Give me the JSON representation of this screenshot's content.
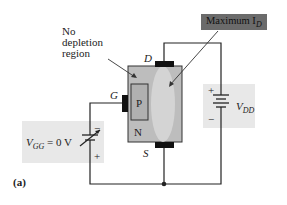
{
  "diagram": {
    "annotations": {
      "no_depletion": [
        "No",
        "depletion",
        "region"
      ],
      "maximum_id": "Maximum I",
      "maximum_id_sub": "D"
    },
    "terminals": {
      "drain": "D",
      "gate": "G",
      "source": "S"
    },
    "regions": {
      "p": "P",
      "n": "N"
    },
    "sources": {
      "vgg_label": "V",
      "vgg_sub": "GG",
      "vgg_value": " = 0 V",
      "vgg_plus": "+",
      "vgg_minus": "−",
      "vdd_label": "V",
      "vdd_sub": "DD",
      "vdd_plus": "+",
      "vdd_minus": "−"
    },
    "panel_label": "(a)",
    "colors": {
      "device_fill": "#bdbdbd",
      "channel_fill": "#d6d6d6",
      "pad": "#111111",
      "label_box": "#6b6b6b",
      "shade": "#e8e8e8",
      "wire": "#222222"
    }
  }
}
